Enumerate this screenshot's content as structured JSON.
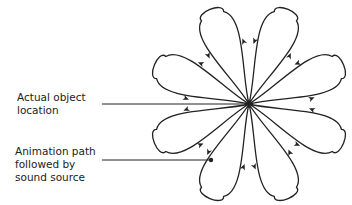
{
  "diagram": {
    "labels": {
      "actual_location": [
        "Actual object",
        "location"
      ],
      "animation_path": [
        "Animation path",
        "followed by",
        "sound source"
      ]
    },
    "colors": {
      "stroke": "#222222",
      "text": "#222222",
      "background": "#ffffff"
    },
    "flower": {
      "center": [
        249,
        104
      ],
      "petal_count": 8,
      "petal_length": 97,
      "petal_half_width": 20,
      "petal_angles_deg": [
        -112.5,
        -67.5,
        -22.5,
        22.5,
        67.5,
        112.5,
        157.5,
        -157.5
      ]
    },
    "pointers": {
      "actual_location_line": {
        "from": [
          102,
          104
        ],
        "to": [
          249,
          104
        ]
      },
      "animation_path_line": {
        "from": [
          102,
          160
        ],
        "to": [
          211,
          160
        ],
        "dot": [
          211,
          160
        ]
      }
    }
  }
}
